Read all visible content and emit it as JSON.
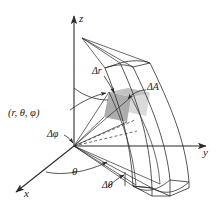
{
  "figure": {
    "type": "spherical-coordinates-volume-element-diagram",
    "background_color": "#ffffff",
    "line_color": "#2b2b2b",
    "shade_dark_color": "#a9a9a9",
    "shade_light_color": "#d5d5d5"
  },
  "axes": {
    "z_label": "z",
    "y_label": "y",
    "x_label": "x"
  },
  "labels": {
    "coordinate_point": "(r, θ, φ)",
    "delta_r": "Δr",
    "delta_area": "ΔA",
    "delta_phi": "Δφ",
    "delta_theta": "Δθ",
    "theta": "θ"
  },
  "icons": {
    "arrowhead": "axis-arrowhead-icon",
    "leader_arrow": "leader-arrow-icon",
    "dashed_ray": "dashed-ray-icon"
  }
}
